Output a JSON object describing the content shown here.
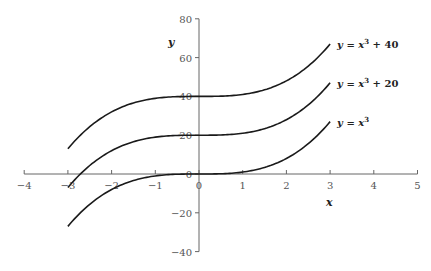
{
  "chart_data": {
    "type": "line",
    "title": "",
    "xlabel": "x",
    "ylabel": "y",
    "xlim": [
      -4,
      5
    ],
    "ylim": [
      -40,
      80
    ],
    "x_ticks": [
      -4,
      -3,
      -2,
      -1,
      0,
      1,
      2,
      3,
      4,
      5
    ],
    "y_ticks": [
      -40,
      -20,
      0,
      20,
      40,
      60,
      80
    ],
    "grid": false,
    "legend": "inline labels at right end of each curve",
    "series": [
      {
        "name": "y = x^3 + 40",
        "label_main": "y = x",
        "label_sup": "3",
        "label_tail": " + 40",
        "offset": 40,
        "x_range": [
          -3,
          3
        ],
        "x": [
          -3,
          -2,
          -1,
          0,
          1,
          2,
          3
        ],
        "values": [
          13,
          32,
          39,
          40,
          41,
          48,
          67
        ]
      },
      {
        "name": "y = x^3 + 20",
        "label_main": "y = x",
        "label_sup": "3",
        "label_tail": " + 20",
        "offset": 20,
        "x_range": [
          -3,
          3
        ],
        "x": [
          -3,
          -2,
          -1,
          0,
          1,
          2,
          3
        ],
        "values": [
          -7,
          12,
          19,
          20,
          21,
          28,
          47
        ]
      },
      {
        "name": "y = x^3",
        "label_main": "y = x",
        "label_sup": "3",
        "label_tail": "",
        "offset": 0,
        "x_range": [
          -3,
          3
        ],
        "x": [
          -3,
          -2,
          -1,
          0,
          1,
          2,
          3
        ],
        "values": [
          -27,
          -8,
          -1,
          0,
          1,
          8,
          27
        ]
      }
    ]
  },
  "colors": {
    "curve": "#1a1a1a",
    "axis": "#666666",
    "tick_text": "#555555"
  }
}
